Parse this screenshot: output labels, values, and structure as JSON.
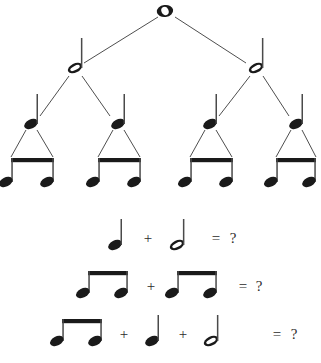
{
  "page": {
    "width": 321,
    "height": 363,
    "background_color": "#ffffff",
    "ink_color": "#1a1a1a",
    "text_color": "#2b2b2b"
  },
  "tree": {
    "description": "Rhythm tree subdividing a whole note into halves, quarters and beamed eighths",
    "levels": [
      {
        "level": 0,
        "note_type": "whole-note",
        "count": 1,
        "nodes": [
          {
            "id": "w1",
            "x": 165,
            "y": 11
          }
        ]
      },
      {
        "level": 1,
        "note_type": "half-note",
        "count": 2,
        "nodes": [
          {
            "id": "h1",
            "x": 75,
            "y": 68
          },
          {
            "id": "h2",
            "x": 256,
            "y": 68
          }
        ]
      },
      {
        "level": 2,
        "note_type": "quarter-note",
        "count": 4,
        "nodes": [
          {
            "id": "q1",
            "x": 31,
            "y": 124
          },
          {
            "id": "q2",
            "x": 118,
            "y": 124
          },
          {
            "id": "q3",
            "x": 210,
            "y": 124
          },
          {
            "id": "q4",
            "x": 296,
            "y": 124
          }
        ]
      },
      {
        "level": 3,
        "note_type": "beamed-eighth-pair",
        "count": 4,
        "nodes": [
          {
            "id": "e1",
            "x": 31,
            "y": 180
          },
          {
            "id": "e2",
            "x": 118,
            "y": 180
          },
          {
            "id": "e3",
            "x": 210,
            "y": 180
          },
          {
            "id": "e4",
            "x": 296,
            "y": 180
          }
        ]
      }
    ],
    "edges": [
      {
        "from": "w1",
        "to": "h1"
      },
      {
        "from": "w1",
        "to": "h2"
      },
      {
        "from": "h1",
        "to": "q1"
      },
      {
        "from": "h1",
        "to": "q2"
      },
      {
        "from": "h2",
        "to": "q3"
      },
      {
        "from": "h2",
        "to": "q4"
      },
      {
        "from": "q1",
        "to": "e1"
      },
      {
        "from": "q2",
        "to": "e2"
      },
      {
        "from": "q3",
        "to": "e3"
      },
      {
        "from": "q4",
        "to": "e4"
      }
    ]
  },
  "equations": [
    {
      "id": "equation-1",
      "terms": [
        "quarter-note",
        "half-note"
      ],
      "operators": [
        "+"
      ],
      "equals_sign": "=",
      "answer": "?",
      "answer_blank": true
    },
    {
      "id": "equation-2",
      "terms": [
        "beamed-eighth-pair",
        "beamed-eighth-pair"
      ],
      "operators": [
        "+"
      ],
      "equals_sign": "=",
      "answer": "?",
      "answer_blank": true
    },
    {
      "id": "equation-3",
      "terms": [
        "beamed-eighth-pair",
        "quarter-note",
        "half-note"
      ],
      "operators": [
        "+",
        "+"
      ],
      "equals_sign": "=",
      "answer": "?",
      "answer_blank": true
    }
  ],
  "symbols": {
    "plus": "+",
    "equals": "=",
    "question": "?"
  }
}
